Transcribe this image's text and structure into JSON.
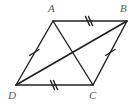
{
  "figure": {
    "type": "geometry-diagram",
    "shape": "parallelogram",
    "background_color": "#ffffff",
    "stroke_color": "#231f20",
    "label_color": "#58585a",
    "stroke_width": 1.4,
    "vertices": [
      {
        "name": "A",
        "label": "A",
        "x": 53,
        "y": 21,
        "label_x": 48,
        "label_y": 3
      },
      {
        "name": "B",
        "label": "B",
        "x": 127,
        "y": 21,
        "label_x": 120,
        "label_y": 3
      },
      {
        "name": "C",
        "label": "C",
        "x": 93,
        "y": 85,
        "label_x": 89,
        "label_y": 90
      },
      {
        "name": "D",
        "label": "D",
        "x": 16,
        "y": 85,
        "label_x": 8,
        "label_y": 90
      }
    ],
    "sides": [
      {
        "name": "AB",
        "from": "A",
        "to": "B",
        "x1": 53,
        "y1": 21,
        "x2": 127,
        "y2": 21,
        "tick_count": 2,
        "tick_x": 88,
        "tick_y": 21
      },
      {
        "name": "BC",
        "from": "B",
        "to": "C",
        "x1": 127,
        "y1": 21,
        "x2": 93,
        "y2": 85,
        "tick_count": 1,
        "tick_x": 110,
        "tick_y": 53
      },
      {
        "name": "DC",
        "from": "D",
        "to": "C",
        "x1": 16,
        "y1": 85,
        "x2": 93,
        "y2": 85,
        "tick_count": 2,
        "tick_x": 53,
        "tick_y": 85
      },
      {
        "name": "AD",
        "from": "A",
        "to": "D",
        "x1": 53,
        "y1": 21,
        "x2": 16,
        "y2": 85,
        "tick_count": 1,
        "tick_x": 34,
        "tick_y": 53
      }
    ],
    "diagonals": [
      {
        "name": "AC",
        "from": "A",
        "to": "C",
        "x1": 53,
        "y1": 21,
        "x2": 93,
        "y2": 85
      },
      {
        "name": "DB",
        "from": "D",
        "to": "B",
        "x1": 16,
        "y1": 85,
        "x2": 127,
        "y2": 21
      }
    ],
    "tick_marks": {
      "style": "slash",
      "length": 9,
      "spacing": 3,
      "description": "congruence hash marks: double on AB and DC, single on AD and BC"
    }
  }
}
